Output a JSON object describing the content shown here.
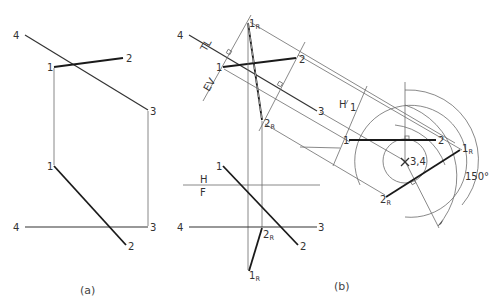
{
  "figure": {
    "panels": [
      {
        "id": "a",
        "caption": "(a)",
        "top_view": {
          "points": {
            "1": "1",
            "2": "2",
            "3": "3",
            "4": "4"
          }
        },
        "front_view": {
          "points": {
            "1": "1",
            "2": "2",
            "3": "3",
            "4": "4"
          }
        }
      },
      {
        "id": "b",
        "caption": "(b)",
        "top_view": {
          "points": {
            "1": "1",
            "2": "2",
            "3": "3",
            "4": "4",
            "1R": "1",
            "1R_sub": "R",
            "2R": "2",
            "2R_sub": "R"
          },
          "labels": {
            "tl": "TL",
            "ev": "EV"
          }
        },
        "fold_line": {
          "upper": "H",
          "lower": "F"
        },
        "aux_fold_line": {
          "upper": "H",
          "lower": "1"
        },
        "front_view": {
          "points": {
            "1": "1",
            "2": "2",
            "3": "3",
            "4": "4",
            "1R": "1",
            "1R_sub": "R",
            "2R": "2",
            "2R_sub": "R"
          }
        },
        "aux_view": {
          "points": {
            "1": "1",
            "2": "2",
            "34": "3,4",
            "1R": "1",
            "1R_sub": "R",
            "2R": "2",
            "2R_sub": "R"
          },
          "angle": "150°"
        }
      }
    ]
  },
  "colors": {
    "line_thin": "#6b6b6b",
    "line_thick": "#1a1a1a",
    "text": "#333333",
    "background": "#ffffff"
  }
}
